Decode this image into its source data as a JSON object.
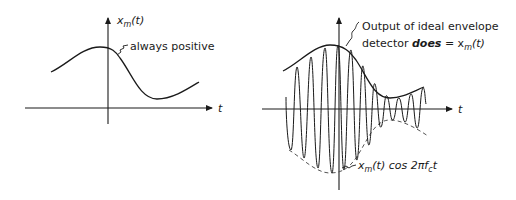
{
  "figure": {
    "left_panel": {
      "y_axis_label": "x",
      "y_axis_label_sub": "m",
      "y_axis_label_arg": "(t)",
      "x_axis_label": "t",
      "annotation": "always positive",
      "curve": "x_m(t) message signal, positive everywhere"
    },
    "right_panel": {
      "x_axis_label": "t",
      "annotation_top_line1": "Output of ideal envelope",
      "annotation_top_line2_pre": "detector ",
      "annotation_top_line2_emph": "does",
      "annotation_top_line2_post": " = x",
      "annotation_top_line2_sub": "m",
      "annotation_top_line2_arg": "(t)",
      "annotation_bottom_pre": "x",
      "annotation_bottom_sub": "m",
      "annotation_bottom_mid": "(t) cos 2πf",
      "annotation_bottom_sub2": "c",
      "annotation_bottom_post": "t",
      "signal": "AM carrier x_m(t) cos 2π f_c t with solid upper envelope and dashed lower envelope"
    },
    "colors": {
      "ink": "#1a1a1a",
      "background": "#ffffff"
    }
  }
}
